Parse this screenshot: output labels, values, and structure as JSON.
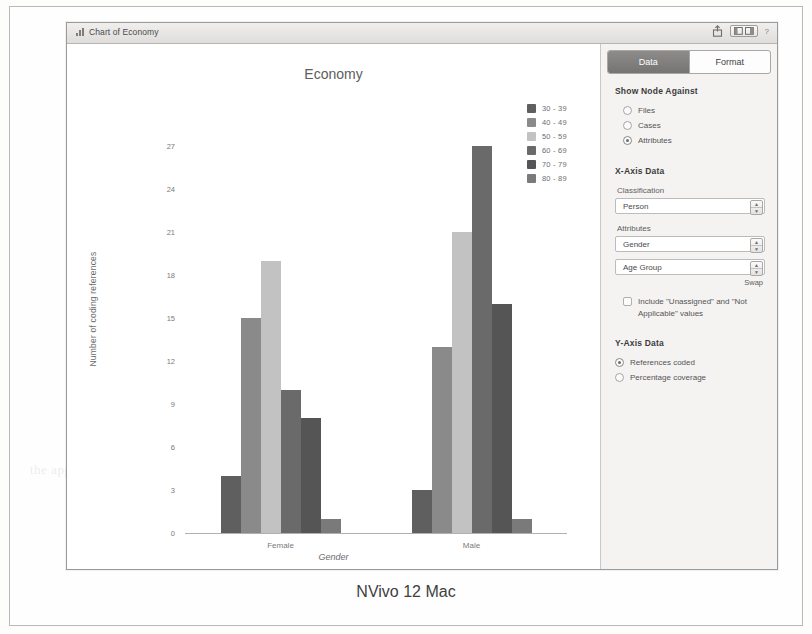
{
  "window": {
    "title": "Chart of Economy",
    "icons": {
      "chart_bars": "bar-chart-icon",
      "share": "share-icon",
      "layout": "layout-toggle-icon",
      "help": "?"
    }
  },
  "chart_data": {
    "type": "bar",
    "title": "Economy",
    "xlabel": "Gender",
    "ylabel": "Number of coding references",
    "categories": [
      "Female",
      "Male"
    ],
    "ylim": [
      0,
      28
    ],
    "yticks": [
      0,
      3,
      6,
      9,
      12,
      15,
      18,
      21,
      24,
      27
    ],
    "grid": false,
    "legend_position": "top-right",
    "series": [
      {
        "name": "30 - 39",
        "color": "#5f5f5f",
        "values": [
          4,
          3
        ]
      },
      {
        "name": "40 - 49",
        "color": "#8a8a8a",
        "values": [
          15,
          13
        ]
      },
      {
        "name": "50 - 59",
        "color": "#c2c2c2",
        "values": [
          19,
          21
        ]
      },
      {
        "name": "60 - 69",
        "color": "#6a6a6a",
        "values": [
          10,
          27
        ]
      },
      {
        "name": "70 - 79",
        "color": "#555555",
        "values": [
          8,
          16
        ]
      },
      {
        "name": "80 - 89",
        "color": "#7a7a7a",
        "values": [
          1,
          1
        ]
      }
    ]
  },
  "panel": {
    "tabs": [
      {
        "label": "Data",
        "selected": true
      },
      {
        "label": "Format",
        "selected": false
      }
    ],
    "show_node_against": {
      "heading": "Show Node Against",
      "options": [
        {
          "label": "Files",
          "selected": false
        },
        {
          "label": "Cases",
          "selected": false
        },
        {
          "label": "Attributes",
          "selected": true
        }
      ]
    },
    "x_axis": {
      "heading": "X-Axis Data",
      "classification_label": "Classification",
      "classification_value": "Person",
      "attributes_label": "Attributes",
      "attribute_1": "Gender",
      "attribute_2": "Age Group",
      "swap_label": "Swap",
      "include_label": "Include \"Unassigned\" and \"Not Applicable\" values",
      "include_checked": false
    },
    "y_axis": {
      "heading": "Y-Axis Data",
      "options": [
        {
          "label": "References coded",
          "selected": true
        },
        {
          "label": "Percentage coverage",
          "selected": false
        }
      ]
    }
  },
  "caption": "NVivo 12 Mac",
  "ghost_text": {
    "a": "presentation and",
    "b": "reference coding",
    "c": "the appearance of"
  }
}
